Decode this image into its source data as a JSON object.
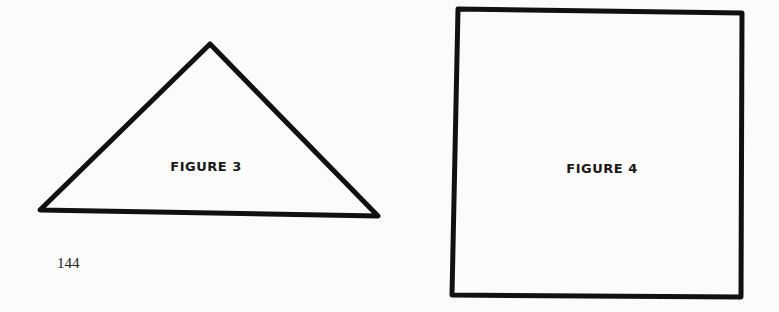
{
  "page": {
    "page_number": "144",
    "background_color": "#fbfbf9",
    "ink_color": "#111111"
  },
  "figures": [
    {
      "label": "FIGURE 3",
      "shape": "triangle",
      "points": [
        [
          210,
          44
        ],
        [
          378,
          216
        ],
        [
          40,
          210
        ]
      ]
    },
    {
      "label": "FIGURE 4",
      "shape": "square",
      "points": [
        [
          458,
          9
        ],
        [
          742,
          13
        ],
        [
          741,
          297
        ],
        [
          452,
          295
        ]
      ]
    }
  ]
}
